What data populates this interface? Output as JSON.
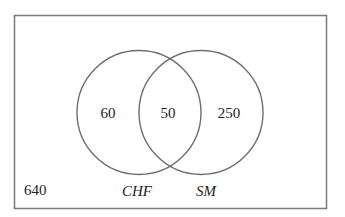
{
  "diagram": {
    "type": "venn",
    "universe": {
      "outside_count": "640"
    },
    "sets": [
      {
        "label": "CHF",
        "only_count": "60"
      },
      {
        "label": "SM",
        "only_count": "250"
      }
    ],
    "intersection": {
      "count": "50"
    },
    "colors": {
      "stroke": "#6e6e6e",
      "text": "#222222",
      "background": "#ffffff"
    }
  }
}
